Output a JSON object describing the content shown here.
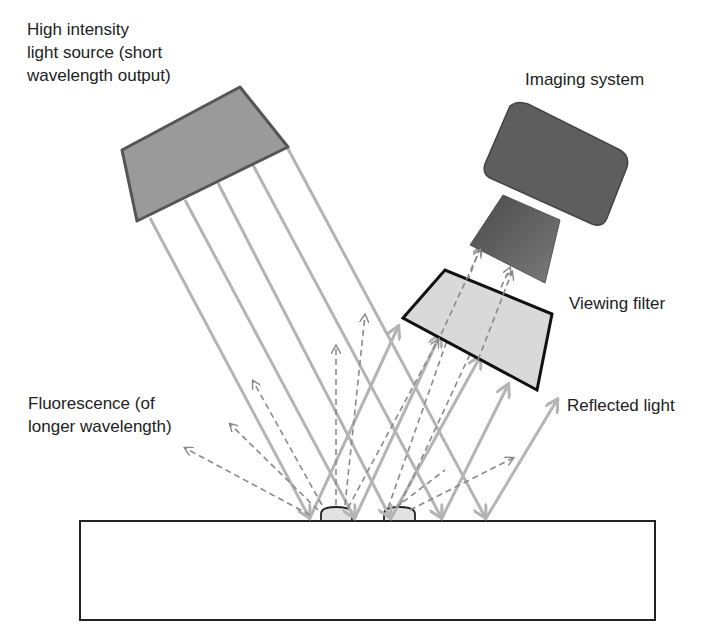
{
  "labels": {
    "light_source": [
      "High intensity",
      "light source (short",
      "wavelength output)"
    ],
    "imaging_system": "Imaging system",
    "viewing_filter": "Viewing filter",
    "reflected_light": "Reflected light",
    "fluorescence": [
      "Fluorescence (of",
      "longer wavelength)"
    ]
  },
  "colors": {
    "ray": "#b4b4b4",
    "dashed_ray": "#8a8a8a",
    "source_fill": "#9a9a9a",
    "source_stroke": "#555555",
    "camera_fill": "#5e5e5e",
    "filter_fill": "#d9d9d9",
    "outline": "#111111"
  }
}
